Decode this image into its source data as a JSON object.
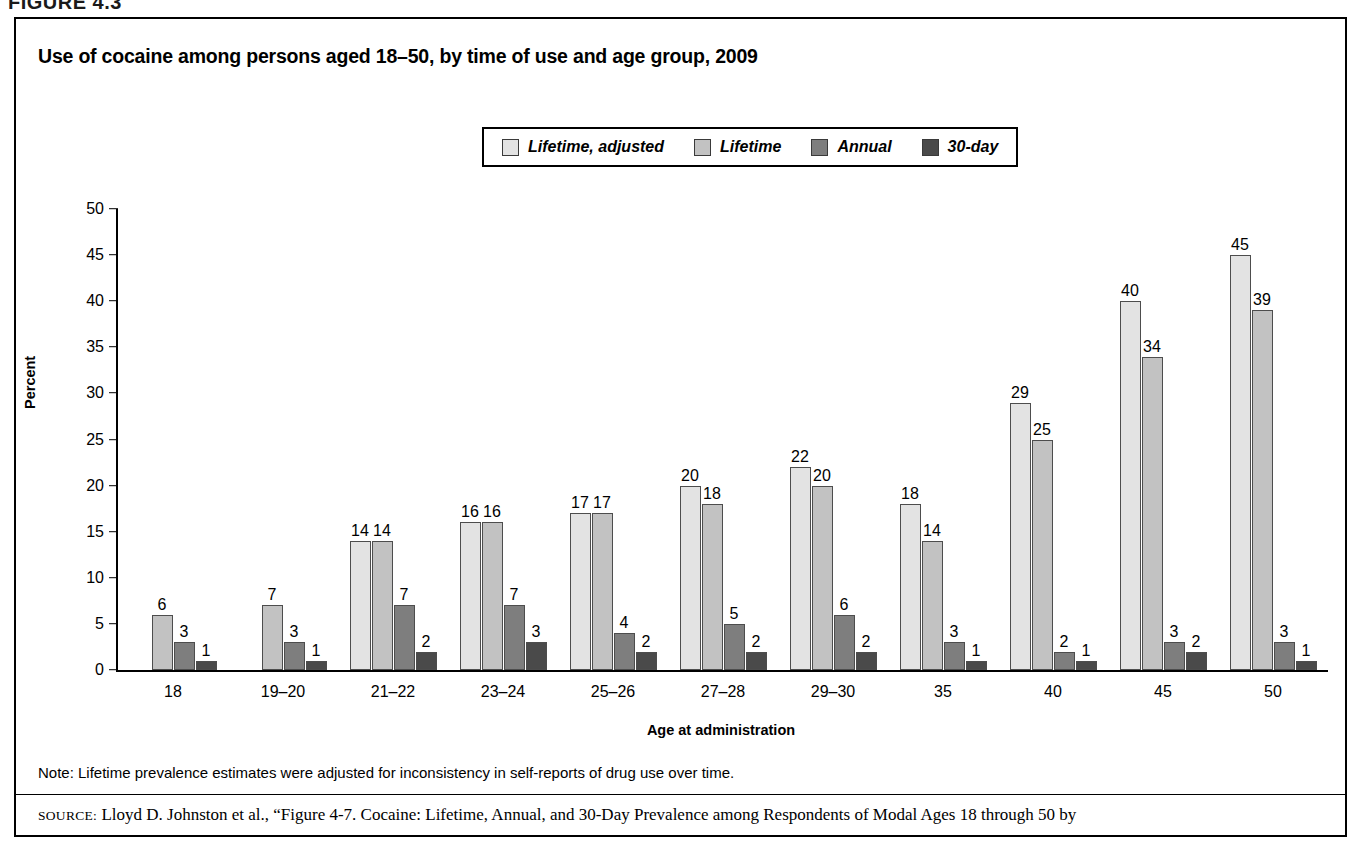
{
  "figure": {
    "label": "FIGURE 4.3",
    "title": "Use of cocaine among persons aged 18–50, by time of use and age group, 2009",
    "x_axis_title": "Age at administration",
    "y_axis_title": "Percent",
    "note": "Note: Lifetime prevalence estimates were adjusted for inconsistency in self-reports of drug use over time.",
    "source_prefix": "SOURCE:",
    "source_text": " Lloyd D. Johnston et al., “Figure 4-7. Cocaine: Lifetime, Annual, and 30-Day Prevalence among Respondents of Modal Ages 18 through 50 by"
  },
  "colors": {
    "lifetime_adjusted": "#e3e3e3",
    "lifetime": "#c2c2c2",
    "annual": "#7e7e7e",
    "thirty_day": "#4a4a4a",
    "axis": "#000000",
    "bar_outline": "#4d4d4d",
    "panel_border": "#000000",
    "background": "#ffffff"
  },
  "legend": {
    "items": [
      {
        "label": "Lifetime, adjusted",
        "color": "#e3e3e3"
      },
      {
        "label": "Lifetime",
        "color": "#c2c2c2"
      },
      {
        "label": "Annual",
        "color": "#7e7e7e"
      },
      {
        "label": "30-day",
        "color": "#4a4a4a"
      }
    ]
  },
  "chart_data": {
    "type": "bar",
    "title": "Use of cocaine among persons aged 18–50, by time of use and age group, 2009",
    "xlabel": "Age at administration",
    "ylabel": "Percent",
    "ylim": [
      0,
      50
    ],
    "yticks": [
      0,
      5,
      10,
      15,
      20,
      25,
      30,
      35,
      40,
      45,
      50
    ],
    "grid": false,
    "legend_position": "top-center",
    "categories": [
      "18",
      "19–20",
      "21–22",
      "23–24",
      "25–26",
      "27–28",
      "29–30",
      "35",
      "40",
      "45",
      "50"
    ],
    "series": [
      {
        "name": "Lifetime, adjusted",
        "color": "#e3e3e3",
        "values": [
          null,
          null,
          14,
          16,
          17,
          20,
          22,
          18,
          29,
          40,
          45
        ]
      },
      {
        "name": "Lifetime",
        "color": "#c2c2c2",
        "values": [
          6,
          7,
          14,
          16,
          17,
          18,
          20,
          14,
          25,
          34,
          39
        ]
      },
      {
        "name": "Annual",
        "color": "#7e7e7e",
        "values": [
          3,
          3,
          7,
          7,
          4,
          5,
          6,
          3,
          2,
          3,
          3
        ]
      },
      {
        "name": "30-day",
        "color": "#4a4a4a",
        "values": [
          1,
          1,
          2,
          3,
          2,
          2,
          2,
          1,
          1,
          2,
          1
        ]
      }
    ]
  }
}
